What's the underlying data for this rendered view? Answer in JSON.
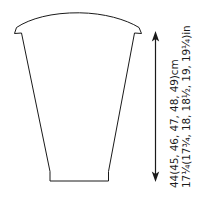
{
  "diagram": {
    "type": "garment-pattern-schematic",
    "piece_name": "sleeve-panel",
    "background_color": "#ffffff",
    "line_color": "#1a1a1a"
  },
  "measurements": {
    "vertical": {
      "cm_line": "44(45, 46, 47, 48, 49)cm",
      "in_line": "17¼(17¾, 18, 18½, 19, 19¼)in",
      "base_cm": 44,
      "sizes_cm": [
        44,
        45,
        46,
        47,
        48,
        49
      ],
      "base_in": "17¼",
      "sizes_in": [
        "17¼",
        "17¾",
        "18",
        "18½",
        "19",
        "19¼"
      ],
      "unit_cm": "cm",
      "unit_in": "in",
      "arrow_style": "double-headed"
    }
  }
}
